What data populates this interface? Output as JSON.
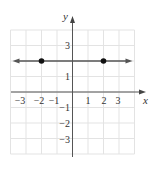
{
  "chart_data": {
    "type": "line",
    "title": "",
    "xlabel": "x",
    "ylabel": "y",
    "xlim": [
      -4,
      4
    ],
    "ylim": [
      -4,
      4
    ],
    "grid": true,
    "x_ticks": [
      "-3",
      "-2",
      "-1",
      "1",
      "2",
      "3"
    ],
    "y_ticks": [
      "3",
      "1",
      "-1",
      "-2",
      "-3"
    ],
    "series": [
      {
        "name": "y = 2",
        "kind": "horizontal line with arrows at both ends",
        "equation": "y = 2",
        "x": [
          -4,
          4
        ],
        "y": [
          2,
          2
        ]
      }
    ],
    "points": [
      {
        "x": -2,
        "y": 2
      },
      {
        "x": 2,
        "y": 2
      }
    ],
    "colors": {
      "line": "#555555",
      "point": "#111111",
      "grid": "#e3e3e3",
      "axis": "#555555"
    }
  },
  "labels": {
    "x_axis": "x",
    "y_axis": "y",
    "x_ticks": [
      {
        "text": "−3",
        "x": 20
      },
      {
        "text": "−2",
        "x": 39
      },
      {
        "text": "−1",
        "x": 54
      },
      {
        "text": "1",
        "x": 88
      },
      {
        "text": "2",
        "x": 104
      },
      {
        "text": "3",
        "x": 118
      }
    ],
    "y_ticks": [
      {
        "text": "3",
        "y": 49
      },
      {
        "text": "1",
        "y": 80
      },
      {
        "text": "−1",
        "y": 111
      },
      {
        "text": "−2",
        "y": 127
      },
      {
        "text": "−3",
        "y": 143
      }
    ]
  }
}
